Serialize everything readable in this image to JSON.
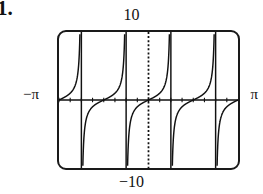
{
  "problem": {
    "number": "1."
  },
  "labels": {
    "top": "10",
    "bottom": "−10",
    "left": "−π",
    "right": "π"
  },
  "chart_data": {
    "type": "line",
    "title": "",
    "subtitle": "",
    "xlabel": "",
    "ylabel": "",
    "function": "y = tan(2x)",
    "grid": false,
    "legend": null,
    "legend_position": "none",
    "xlim": [
      -3.14159265,
      3.14159265
    ],
    "ylim": [
      -10,
      10
    ],
    "xtick_labels": [
      "−π",
      "π"
    ],
    "ytick_labels": [
      "10",
      "−10"
    ],
    "axes": {
      "x_axis_at_y": 0,
      "y_axis_at_x": 0,
      "x_axis_style": "solid",
      "y_axis_style": "dotted",
      "x_tick_spacing": 0.7853981634,
      "y_tick_spacing": 1.0
    },
    "asymptotes": [
      -2.35619449,
      -0.785398163,
      0.785398163,
      2.35619449
    ],
    "asymptote_labels": [
      "−3π/4",
      "−π/4",
      "π/4",
      "3π/4"
    ],
    "branches": [
      {
        "name": "branch-1",
        "x_range": [
          -3.14159265,
          -2.35619449
        ]
      },
      {
        "name": "branch-2",
        "x_range": [
          -2.35619449,
          -0.785398163
        ]
      },
      {
        "name": "branch-3",
        "x_range": [
          -0.785398163,
          0.785398163
        ]
      },
      {
        "name": "branch-4",
        "x_range": [
          0.785398163,
          2.35619449
        ]
      },
      {
        "name": "branch-5",
        "x_range": [
          2.35619449,
          3.14159265
        ]
      }
    ],
    "colors": {
      "curve": "#111111",
      "axis": "#111111",
      "frame": "#1a1a1a",
      "background": "#ffffff"
    }
  }
}
